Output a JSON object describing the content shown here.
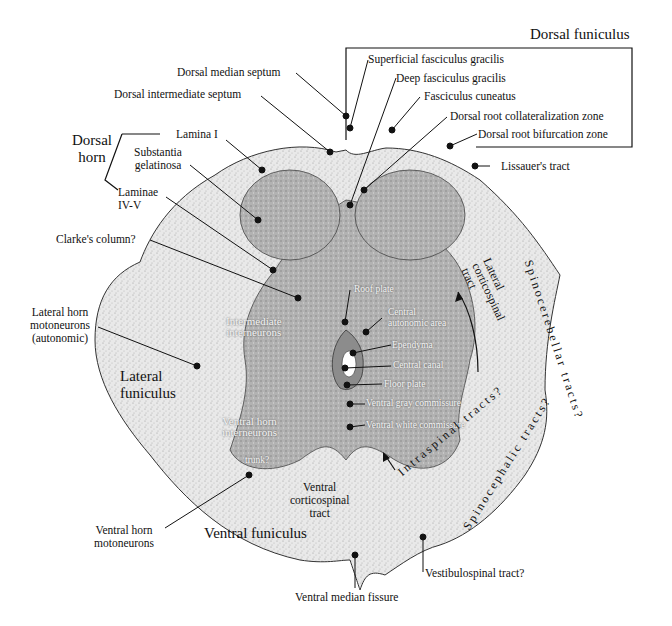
{
  "diagram": {
    "headings": {
      "dorsal_funiculus": "Dorsal funiculus",
      "dorsal_horn": "Dorsal\nhorn",
      "lateral_funiculus": "Lateral\nfuniculus",
      "ventral_funiculus": "Ventral funiculus"
    },
    "labels": {
      "dorsal_median_septum": "Dorsal median septum",
      "dorsal_intermediate_septum": "Dorsal intermediate septum",
      "superficial_fasciculus_gracilis": "Superficial fasciculus gracilis",
      "deep_fasciculus_gracilis": "Deep fasciculus gracilis",
      "fasciculus_cuneatus": "Fasciculus cuneatus",
      "dorsal_root_collateralization_zone": "Dorsal root collateralization zone",
      "dorsal_root_bifurcation_zone": "Dorsal root bifurcation zone",
      "lissauers_tract": "Lissauer's tract",
      "lamina_i": "Lamina I",
      "substantia_gelatinosa": "Substantia\ngelatinosa",
      "laminae_iv_v": "Laminae\nIV-V",
      "clarkes_column": "Clarke's column?",
      "lateral_horn_motoneurons": "Lateral horn\nmotoneurons\n(autonomic)",
      "intermediate_interneurons": "Intermediate\ninterneurons",
      "roof_plate": "Roof plate",
      "central_autonomic_area": "Central\nautonomic area",
      "ependyma": "Ependyma",
      "central_canal": "Central canal",
      "floor_plate": "Floor plate",
      "ventral_gray_commissure": "Ventral gray commissure",
      "ventral_white_commissure": "Ventral white commissure",
      "ventral_horn_interneurons": "Ventral horn\ninterneurons",
      "trunk": "trunk?",
      "ventral_horn_motoneurons": "Ventral horn\nmotoneurons",
      "ventral_corticospinal_tract": "Ventral\ncorticospinal\ntract",
      "ventral_median_fissure": "Ventral median fissure",
      "vestibulospinal_tract": "Vestibulospinal tract?",
      "lateral_corticospinal_tract": "Lateral\ncorticospinal\ntract",
      "spinocerebellar_tracts": "Spinocerebellar tracts?",
      "intraspinal_tracts": "Intraspinal tracts?",
      "spinocephalic_tracts": "Spinocephalic tracts?"
    },
    "colors": {
      "white_matter": "#e6e6e6",
      "gray_matter": "#a9a9a9",
      "dense_gray": "#8c8c8c",
      "outline": "#333333",
      "canal": "#ffffff"
    }
  }
}
